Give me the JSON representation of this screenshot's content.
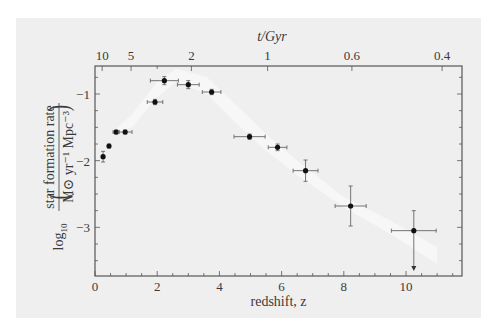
{
  "chart_data": {
    "type": "scatter",
    "title": "",
    "xlabel": "redshift, z",
    "ylabel": "log10( star formation rate / M⊙ yr⁻¹ Mpc⁻³ )",
    "ylabel_parts": {
      "prefix": "log",
      "prefix_sub": "10",
      "numerator": "star formation rate",
      "denominator": "M⊙ yr⁻¹ Mpc⁻³"
    },
    "top_xlabel": "t/Gyr",
    "xlim": [
      0,
      11.8
    ],
    "ylim": [
      -3.73,
      -0.58
    ],
    "x_ticks": [
      0,
      2,
      4,
      6,
      8,
      10
    ],
    "x_tick_labels": [
      "0",
      "2",
      "4",
      "6",
      "8",
      "10"
    ],
    "y_ticks": [
      -1,
      -2,
      -3
    ],
    "y_tick_labels": [
      "−1",
      "−2",
      "−3"
    ],
    "top_ticks": [
      {
        "label": "10",
        "z": 0.23
      },
      {
        "label": "5",
        "z": 1.16
      },
      {
        "label": "2",
        "z": 3.1
      },
      {
        "label": "1",
        "z": 5.55
      },
      {
        "label": "0.6",
        "z": 8.26
      },
      {
        "label": "0.4",
        "z": 11.16
      }
    ],
    "grid": false,
    "legend": null,
    "series": [
      {
        "name": "measurements",
        "marker": "filled-circle",
        "color": "#111111",
        "points": [
          {
            "z": 0.26,
            "y": -1.94,
            "xerr": 0.0,
            "yerr": 0.08
          },
          {
            "z": 0.45,
            "y": -1.78,
            "xerr": 0.0,
            "yerr": 0.03
          },
          {
            "z": 0.68,
            "y": -1.57,
            "xerr": 0.1,
            "yerr": 0.03
          },
          {
            "z": 0.97,
            "y": -1.57,
            "xerr": 0.22,
            "yerr": 0.03
          },
          {
            "z": 1.93,
            "y": -1.12,
            "xerr": 0.25,
            "yerr": 0.04
          },
          {
            "z": 2.23,
            "y": -0.8,
            "xerr": 0.45,
            "yerr": 0.06
          },
          {
            "z": 3.0,
            "y": -0.86,
            "xerr": 0.35,
            "yerr": 0.06
          },
          {
            "z": 3.75,
            "y": -0.97,
            "xerr": 0.3,
            "yerr": 0.04
          },
          {
            "z": 4.97,
            "y": -1.64,
            "xerr": 0.5,
            "yerr": 0.04
          },
          {
            "z": 5.87,
            "y": -1.8,
            "xerr": 0.3,
            "yerr": 0.05
          },
          {
            "z": 6.77,
            "y": -2.15,
            "xerr": 0.4,
            "yerr": 0.16
          },
          {
            "z": 8.22,
            "y": -2.68,
            "xerr": 0.5,
            "yerr": 0.3
          },
          {
            "z": 10.25,
            "y": -3.05,
            "xerr": 0.72,
            "yerr_up": 0.3,
            "upper_limit": true
          }
        ]
      },
      {
        "name": "model band",
        "type": "area",
        "color": "#f7f7f7",
        "upper": [
          [
            0.6,
            -1.55
          ],
          [
            1.2,
            -1.3
          ],
          [
            2.0,
            -0.82
          ],
          [
            2.6,
            -0.62
          ],
          [
            3.6,
            -0.75
          ],
          [
            4.4,
            -1.1
          ],
          [
            5.5,
            -1.6
          ],
          [
            6.5,
            -2.0
          ],
          [
            8.0,
            -2.55
          ],
          [
            9.5,
            -2.9
          ],
          [
            11.0,
            -3.3
          ]
        ],
        "lower": [
          [
            0.6,
            -1.62
          ],
          [
            1.2,
            -1.5
          ],
          [
            2.0,
            -1.05
          ],
          [
            2.6,
            -0.82
          ],
          [
            3.6,
            -1.0
          ],
          [
            4.4,
            -1.38
          ],
          [
            5.5,
            -1.85
          ],
          [
            6.5,
            -2.22
          ],
          [
            8.0,
            -2.7
          ],
          [
            9.5,
            -3.1
          ],
          [
            11.0,
            -3.55
          ]
        ]
      }
    ]
  }
}
